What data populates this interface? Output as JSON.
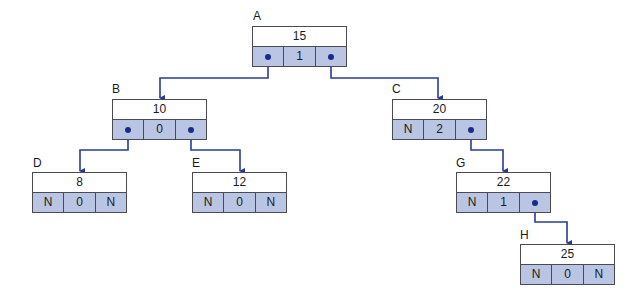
{
  "diagram": {
    "type": "threaded binary tree / AVL node layout",
    "colors": {
      "link": "#2a3a98",
      "pointer_cell_fill": "#b9c5e2",
      "border": "#4a4a52"
    },
    "null_marker": "N",
    "nodes": [
      {
        "id": "A",
        "label": "A",
        "key": "15",
        "left": "ptr",
        "balance": "1",
        "right": "ptr"
      },
      {
        "id": "B",
        "label": "B",
        "key": "10",
        "left": "ptr",
        "balance": "0",
        "right": "ptr"
      },
      {
        "id": "C",
        "label": "C",
        "key": "20",
        "left": "N",
        "balance": "2",
        "right": "ptr"
      },
      {
        "id": "D",
        "label": "D",
        "key": "8",
        "left": "N",
        "balance": "0",
        "right": "N"
      },
      {
        "id": "E",
        "label": "E",
        "key": "12",
        "left": "N",
        "balance": "0",
        "right": "N"
      },
      {
        "id": "G",
        "label": "G",
        "key": "22",
        "left": "N",
        "balance": "1",
        "right": "ptr"
      },
      {
        "id": "H",
        "label": "H",
        "key": "25",
        "left": "N",
        "balance": "0",
        "right": "N"
      }
    ],
    "edges": [
      {
        "from": "A",
        "side": "left",
        "to": "B"
      },
      {
        "from": "A",
        "side": "right",
        "to": "C"
      },
      {
        "from": "B",
        "side": "left",
        "to": "D"
      },
      {
        "from": "B",
        "side": "right",
        "to": "E"
      },
      {
        "from": "C",
        "side": "right",
        "to": "G"
      },
      {
        "from": "G",
        "side": "right",
        "to": "H"
      }
    ]
  }
}
